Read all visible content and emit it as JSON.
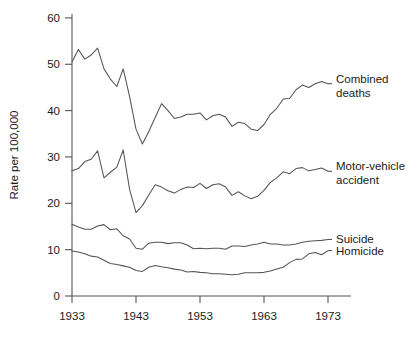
{
  "chart_data": {
    "type": "line",
    "title": "",
    "subtitle": "",
    "xlabel": "",
    "ylabel": "Rate per 100,000",
    "xlim": [
      1933,
      1975
    ],
    "ylim": [
      0,
      60
    ],
    "grid": false,
    "legend_position": "right-inline-labels",
    "x_ticks": [
      "1933",
      "1943",
      "1953",
      "1963",
      "1973"
    ],
    "x_tick_values": [
      1933,
      1943,
      1953,
      1963,
      1973
    ],
    "y_ticks": [
      "0",
      "10",
      "20",
      "30",
      "40",
      "50",
      "60"
    ],
    "y_tick_values": [
      0,
      10,
      20,
      30,
      40,
      50,
      60
    ],
    "x": [
      1933,
      1934,
      1935,
      1936,
      1937,
      1938,
      1939,
      1940,
      1941,
      1942,
      1943,
      1944,
      1945,
      1946,
      1947,
      1948,
      1949,
      1950,
      1951,
      1952,
      1953,
      1954,
      1955,
      1956,
      1957,
      1958,
      1959,
      1960,
      1961,
      1962,
      1963,
      1964,
      1965,
      1966,
      1967,
      1968,
      1969,
      1970,
      1971,
      1972,
      1973
    ],
    "series": [
      {
        "name": "Combined deaths",
        "label": "Combined\ndeaths",
        "label_line1": "Combined",
        "label_line2": "deaths",
        "color": "#545454",
        "values": [
          50.5,
          53.2,
          51.1,
          52.0,
          53.5,
          49.0,
          46.8,
          45.2,
          49.0,
          43.0,
          36.0,
          32.8,
          35.5,
          38.5,
          41.5,
          40.0,
          38.3,
          38.6,
          39.2,
          39.2,
          39.5,
          38.0,
          38.9,
          39.2,
          38.6,
          36.6,
          37.5,
          37.2,
          36.0,
          35.7,
          37.0,
          39.2,
          40.5,
          42.5,
          42.6,
          44.5,
          45.5,
          45.0,
          45.8,
          46.3,
          45.8
        ]
      },
      {
        "name": "Motor-vehicle accident",
        "label": "Motor-vehicle\naccident",
        "label_line1": "Motor-vehicle",
        "label_line2": "accident",
        "color": "#545454",
        "values": [
          27.0,
          27.5,
          29.0,
          29.5,
          31.3,
          25.5,
          26.7,
          27.8,
          31.5,
          23.0,
          18.0,
          19.5,
          21.8,
          24.0,
          23.5,
          22.7,
          22.2,
          23.0,
          23.5,
          23.4,
          24.3,
          23.2,
          24.0,
          24.2,
          23.5,
          21.7,
          22.5,
          21.6,
          21.0,
          21.5,
          22.8,
          24.5,
          25.5,
          26.8,
          26.4,
          27.5,
          27.7,
          27.0,
          27.3,
          27.6,
          26.9
        ]
      },
      {
        "name": "Suicide",
        "label": "Suicide",
        "label_line1": "Suicide",
        "label_line2": "",
        "color": "#545454",
        "values": [
          15.5,
          14.9,
          14.4,
          14.4,
          15.1,
          15.4,
          14.3,
          14.5,
          13.0,
          12.3,
          10.3,
          10.1,
          11.4,
          11.6,
          11.6,
          11.3,
          11.5,
          11.5,
          11.0,
          10.2,
          10.3,
          10.2,
          10.3,
          10.3,
          10.1,
          10.8,
          10.8,
          10.7,
          11.0,
          11.2,
          11.6,
          11.2,
          11.2,
          11.0,
          11.0,
          11.2,
          11.6,
          11.8,
          11.9,
          12.0,
          12.2
        ]
      },
      {
        "name": "Homicide",
        "label": "Homicide",
        "label_line1": "Homicide",
        "label_line2": "",
        "color": "#545454",
        "values": [
          9.7,
          9.5,
          9.1,
          8.6,
          8.4,
          7.7,
          7.0,
          6.8,
          6.5,
          6.2,
          5.5,
          5.3,
          6.2,
          6.6,
          6.3,
          6.1,
          5.8,
          5.6,
          5.2,
          5.3,
          5.1,
          5.0,
          4.8,
          4.8,
          4.7,
          4.6,
          4.7,
          5.0,
          5.0,
          5.0,
          5.1,
          5.4,
          5.8,
          6.2,
          7.2,
          7.9,
          8.0,
          9.1,
          9.4,
          8.9,
          9.8
        ]
      }
    ],
    "annotations": [
      {
        "text": "Combined deaths",
        "for_series": "Combined deaths"
      },
      {
        "text": "Motor-vehicle accident",
        "for_series": "Motor-vehicle accident"
      },
      {
        "text": "Suicide",
        "for_series": "Suicide"
      },
      {
        "text": "Homicide",
        "for_series": "Homicide"
      }
    ],
    "colors": {
      "axis": "#545454",
      "text": "#1a1a1a",
      "background": "#ffffff"
    }
  }
}
